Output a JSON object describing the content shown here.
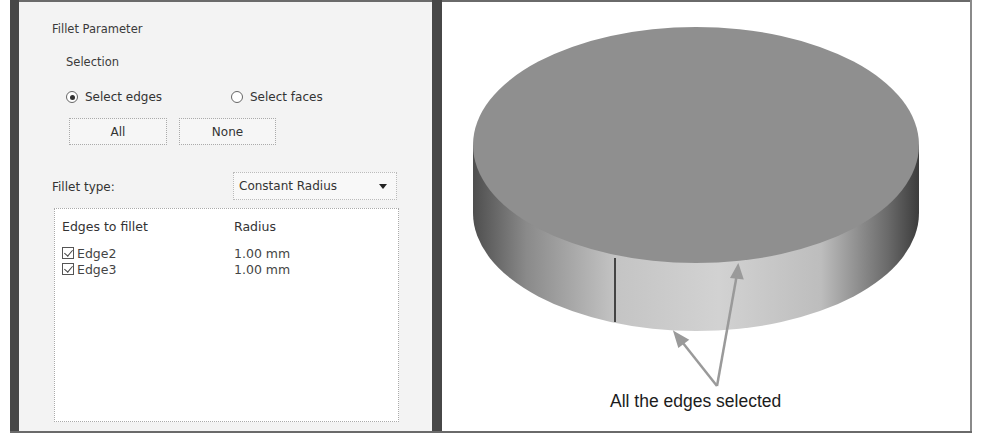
{
  "fillet_panel": {
    "title": "Fillet Parameter",
    "selection_label": "Selection",
    "radios": [
      {
        "label": "Select edges",
        "selected": true
      },
      {
        "label": "Select faces",
        "selected": false
      }
    ],
    "buttons": {
      "all": "All",
      "none": "None"
    },
    "fillet_type_label": "Fillet type:",
    "fillet_type_value": "Constant Radius",
    "list": {
      "headers": {
        "edge": "Edges to fillet",
        "radius": "Radius"
      },
      "rows": [
        {
          "edge": "Edge2",
          "radius": "1.00 mm",
          "checked": true
        },
        {
          "edge": "Edge3",
          "radius": "1.00 mm",
          "checked": true
        }
      ]
    }
  },
  "viewport": {
    "annotation": "All the edges selected",
    "colors": {
      "top_face": "#8f8f8f",
      "side_light": "#cfcfcf",
      "side_dark": "#5a5a5a",
      "arrow": "#9a9a9a"
    }
  }
}
